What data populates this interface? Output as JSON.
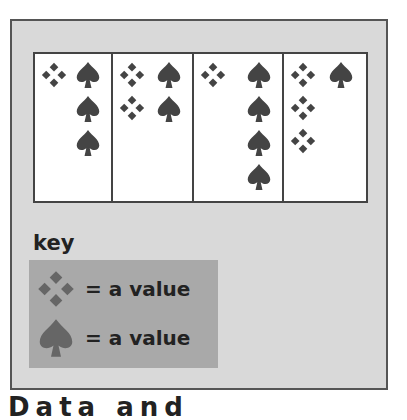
{
  "colors": {
    "panel": "#d9d9d9",
    "table": "#ffffff",
    "border": "#444444",
    "symbol": "#444444",
    "key_bg": "#a9a9a9",
    "key_symbol": "#666666"
  },
  "chart_data": {
    "type": "pictograph",
    "title": "",
    "categories": [
      "1",
      "2",
      "3",
      "4"
    ],
    "series": [
      {
        "name": "diamond-cluster",
        "symbol": "diamond",
        "values": [
          1,
          2,
          1,
          3
        ]
      },
      {
        "name": "spade",
        "symbol": "spade",
        "values": [
          3,
          2,
          4,
          1
        ]
      }
    ],
    "legend": [
      {
        "symbol": "diamond",
        "label": "= a value"
      },
      {
        "symbol": "spade",
        "label": "= a value"
      }
    ]
  },
  "key": {
    "title": "key",
    "items": [
      {
        "label": "= a value"
      },
      {
        "label": "= a value"
      }
    ]
  },
  "bottom_text": "Data and"
}
